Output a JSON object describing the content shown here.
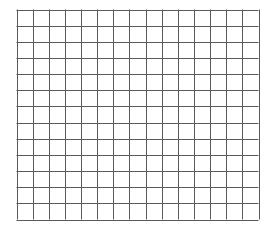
{
  "grid": {
    "columns": 15,
    "rows": 13,
    "left": 16.5,
    "top": 9.5,
    "right": 258.5,
    "bottom": 219.5,
    "line_color": "#5a5a5a",
    "line_width": 1,
    "background": "#ffffff"
  }
}
